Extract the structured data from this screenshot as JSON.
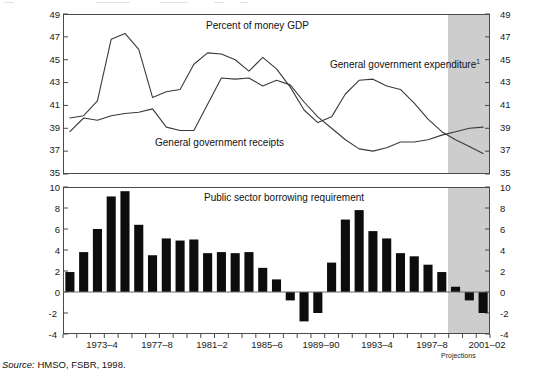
{
  "figure": {
    "width": 543,
    "height": 379,
    "background": "#ffffff",
    "line_color": "#3a3a3a",
    "bar_color": "#0d0d0d",
    "projection_shade_color": "#cdcdcd",
    "frame_color": "#4a4a4a"
  },
  "source_note": {
    "prefix": "Source:",
    "text": " HMSO, FSBR, 1998."
  },
  "annotations": {
    "upper_title": "Percent of money GDP",
    "receipts_label": "General government receipts",
    "expenditure_label": "General government expenditure",
    "expenditure_footnote": "1",
    "lower_title": "Public sector borrowing requirement",
    "projections_label": "Projections"
  },
  "x_axis": {
    "tick_labels": [
      "1973–4",
      "1977–8",
      "1981–2",
      "1985–6",
      "1989–90",
      "1993–4",
      "1997–8",
      "2001–02"
    ],
    "tick_label_years": [
      "1973-4",
      "1977-8",
      "1981-2",
      "1985-6",
      "1989-90",
      "1993-4",
      "1997-8",
      "2001-02"
    ],
    "all_periods": [
      "1971-2",
      "1972-3",
      "1973-4",
      "1974-5",
      "1975-6",
      "1976-7",
      "1977-8",
      "1978-9",
      "1979-80",
      "1980-1",
      "1981-2",
      "1982-3",
      "1983-4",
      "1984-5",
      "1985-6",
      "1986-7",
      "1987-8",
      "1988-9",
      "1989-90",
      "1990-1",
      "1991-2",
      "1992-3",
      "1993-4",
      "1994-5",
      "1995-6",
      "1996-7",
      "1997-8",
      "1998-9",
      "1999-00",
      "2000-01",
      "2001-02"
    ],
    "projection_starts_at": "1997-8"
  },
  "chart_data": [
    {
      "type": "line",
      "panel": "upper",
      "title": "Percent of money GDP",
      "xlabel": "",
      "ylabel": "Percent of money GDP",
      "ylim": [
        35,
        49
      ],
      "ytick_labels": [
        "49",
        "47",
        "45",
        "43",
        "41",
        "39",
        "37",
        "35"
      ],
      "yticks": [
        49,
        47,
        45,
        43,
        41,
        39,
        37,
        35
      ],
      "grid": false,
      "legend": "inline-annotations",
      "x": [
        "1971-2",
        "1972-3",
        "1973-4",
        "1974-5",
        "1975-6",
        "1976-7",
        "1977-8",
        "1978-9",
        "1979-80",
        "1980-1",
        "1981-2",
        "1982-3",
        "1983-4",
        "1984-5",
        "1985-6",
        "1986-7",
        "1987-8",
        "1988-9",
        "1989-90",
        "1990-1",
        "1991-2",
        "1992-3",
        "1993-4",
        "1994-5",
        "1995-6",
        "1996-7",
        "1997-8",
        "1998-9",
        "1999-00",
        "2000-01",
        "2001-02"
      ],
      "series": [
        {
          "name": "General government expenditure",
          "footnote": "1",
          "values": [
            39.9,
            40.1,
            41.4,
            46.8,
            47.3,
            45.9,
            41.7,
            42.2,
            42.4,
            44.6,
            45.6,
            45.5,
            45.0,
            44.0,
            45.2,
            44.2,
            42.6,
            40.6,
            39.5,
            40.0,
            42.0,
            43.2,
            43.3,
            42.7,
            42.4,
            41.2,
            39.8,
            38.7,
            38.0,
            37.4,
            36.8
          ]
        },
        {
          "name": "General government receipts",
          "values": [
            38.7,
            39.9,
            39.7,
            40.1,
            40.3,
            40.4,
            40.7,
            39.1,
            38.8,
            38.8,
            41.1,
            43.4,
            43.3,
            43.4,
            42.7,
            43.2,
            42.8,
            41.3,
            40.0,
            39.0,
            38.0,
            37.2,
            37.0,
            37.3,
            37.8,
            37.8,
            38.0,
            38.4,
            38.7,
            39.0,
            39.1
          ]
        }
      ]
    },
    {
      "type": "bar",
      "panel": "lower",
      "title": "Public sector borrowing requirement",
      "xlabel": "",
      "ylabel": "",
      "ylim": [
        -4,
        10
      ],
      "ytick_labels": [
        "10",
        "8",
        "6",
        "4",
        "2",
        "0",
        "-2",
        "-4"
      ],
      "yticks": [
        10,
        8,
        6,
        4,
        2,
        0,
        -2,
        -4
      ],
      "grid": false,
      "categories": [
        "1971-2",
        "1972-3",
        "1973-4",
        "1974-5",
        "1975-6",
        "1976-7",
        "1977-8",
        "1978-9",
        "1979-80",
        "1980-1",
        "1981-2",
        "1982-3",
        "1983-4",
        "1984-5",
        "1985-6",
        "1986-7",
        "1987-8",
        "1988-9",
        "1989-90",
        "1990-1",
        "1991-2",
        "1992-3",
        "1993-4",
        "1994-5",
        "1995-6",
        "1996-7",
        "1997-8",
        "1998-9",
        "1999-00",
        "2000-01",
        "2001-02"
      ],
      "values": [
        1.9,
        3.8,
        6.0,
        9.1,
        9.6,
        6.4,
        3.5,
        5.1,
        4.9,
        5.0,
        3.7,
        3.8,
        3.7,
        3.8,
        2.3,
        1.2,
        -0.8,
        -2.8,
        -2.0,
        2.8,
        6.9,
        7.8,
        5.8,
        5.1,
        3.7,
        3.4,
        2.6,
        1.9,
        0.5,
        -0.8,
        -2.0
      ]
    }
  ]
}
